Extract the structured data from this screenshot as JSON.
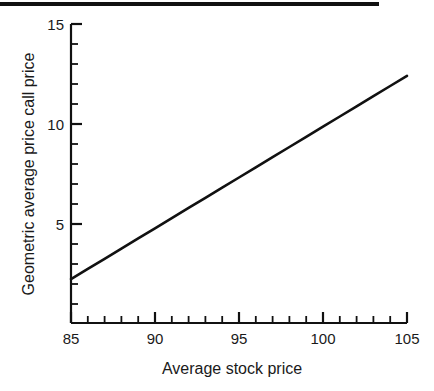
{
  "figure": {
    "background_color": "#ffffff",
    "line_color": "#111111",
    "axis_color": "#111111",
    "top_rule": {
      "name": "page-top-rule",
      "color": "#111111"
    }
  },
  "chart_data": {
    "type": "line",
    "title": "",
    "subtitle": "",
    "xlabel": "Average stock price",
    "ylabel": "Geometric average price call price",
    "xlim": [
      85,
      105
    ],
    "ylim": [
      0,
      15
    ],
    "grid": false,
    "legend": null,
    "legend_position": "none",
    "x_major_ticks": [
      85,
      90,
      95,
      100,
      105
    ],
    "x_major_tick_labels": [
      "85",
      "90",
      "95",
      "100",
      "105"
    ],
    "x_minor_tick_step": 1,
    "y_major_ticks": [
      5,
      10,
      15
    ],
    "y_major_tick_labels": [
      "5",
      "10",
      "15"
    ],
    "y_minor_tick_step": 1,
    "series": [
      {
        "name": "Geometric average price call price",
        "x": [
          85,
          86,
          87,
          88,
          89,
          90,
          91,
          92,
          93,
          94,
          95,
          96,
          97,
          98,
          99,
          100,
          101,
          102,
          103,
          104,
          105
        ],
        "values": [
          2.2,
          2.71,
          3.22,
          3.73,
          4.24,
          4.75,
          5.26,
          5.77,
          6.28,
          6.79,
          7.3,
          7.81,
          8.32,
          8.83,
          9.34,
          9.85,
          10.36,
          10.87,
          11.38,
          11.89,
          12.4
        ]
      }
    ],
    "annotations": []
  },
  "axis_labels": {
    "y_title": "Geometric average price call price",
    "x_title": "Average stock price",
    "y_ticks": [
      "15",
      "10",
      "5"
    ],
    "x_ticks": [
      "85",
      "90",
      "95",
      "100",
      "105"
    ]
  }
}
